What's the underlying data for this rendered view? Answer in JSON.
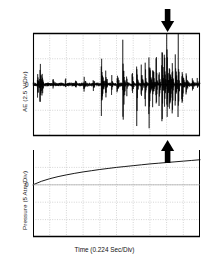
{
  "figure": {
    "title": "",
    "background": "#ffffff",
    "ink_color": "#000000",
    "grid_color": "#b9b9b9",
    "panel_left_px": 33,
    "panel_right_px": 200
  },
  "labels": {
    "ae_axis": "AE (2.5 V/Div)",
    "pressure_axis": "Pressure (5 Atm/Div)",
    "time_axis": "Time (0.224 Sec/Div)",
    "ae_zero": "0",
    "pressure_zero": "0"
  },
  "annotations": [
    {
      "name": "burst-onset-arrow-top",
      "direction": "down",
      "x_frac": 0.806,
      "panel": "ae"
    },
    {
      "name": "burst-onset-arrow-bottom",
      "direction": "up",
      "x_frac": 0.806,
      "panel": "pressure"
    }
  ],
  "chart_data": {
    "type": "line",
    "title": "",
    "xlabel": "Time (0.224 Sec/Div)",
    "grid": true,
    "legend": "none",
    "panels": [
      {
        "name": "acoustic-emission",
        "ylabel": "AE (2.5 V/Div)",
        "ylim": [
          -2,
          2
        ],
        "ytick_labeled": [
          0
        ],
        "xlim": [
          0,
          10
        ],
        "x_divisions": 10,
        "y_divisions": 4,
        "description": "Acoustic emission voltage versus time showing intermittent burst events increasing in rate and amplitude toward the right, with a dense cluster of large bursts just before the arrow marker.",
        "bursts": [
          {
            "t": 0.28,
            "amp": 0.62
          },
          {
            "t": 0.42,
            "amp": 0.95
          },
          {
            "t": 0.55,
            "amp": 0.5
          },
          {
            "t": 1.2,
            "amp": 0.22
          },
          {
            "t": 1.95,
            "amp": 0.18
          },
          {
            "t": 2.55,
            "amp": 0.3
          },
          {
            "t": 3.05,
            "amp": 0.26
          },
          {
            "t": 3.62,
            "amp": 0.24
          },
          {
            "t": 4.1,
            "amp": 1.22
          },
          {
            "t": 4.35,
            "amp": 0.55
          },
          {
            "t": 4.72,
            "amp": 0.34
          },
          {
            "t": 5.05,
            "amp": 0.42
          },
          {
            "t": 5.38,
            "amp": 1.55
          },
          {
            "t": 5.62,
            "amp": 0.48
          },
          {
            "t": 5.95,
            "amp": 0.6
          },
          {
            "t": 6.22,
            "amp": 1.3
          },
          {
            "t": 6.48,
            "amp": 0.7
          },
          {
            "t": 6.72,
            "amp": 1.05
          },
          {
            "t": 6.95,
            "amp": 1.48
          },
          {
            "t": 7.18,
            "amp": 0.86
          },
          {
            "t": 7.38,
            "amp": 1.6
          },
          {
            "t": 7.55,
            "amp": 1.1
          },
          {
            "t": 7.72,
            "amp": 1.75
          },
          {
            "t": 7.88,
            "amp": 1.35
          },
          {
            "t": 8.02,
            "amp": 1.92
          },
          {
            "t": 8.18,
            "amp": 1.45
          },
          {
            "t": 8.34,
            "amp": 1.68
          },
          {
            "t": 8.52,
            "amp": 1.2
          },
          {
            "t": 8.7,
            "amp": 1.85
          },
          {
            "t": 8.92,
            "amp": 0.92
          },
          {
            "t": 9.18,
            "amp": 0.46
          },
          {
            "t": 9.55,
            "amp": 0.3
          },
          {
            "t": 9.85,
            "amp": 0.22
          }
        ],
        "baseline_noise_amp": 0.07
      },
      {
        "name": "pressure",
        "ylabel": "Pressure (5 Atm/Div)",
        "ylim": [
          -3,
          2
        ],
        "ytick_labeled": [
          0
        ],
        "xlim": [
          0,
          10
        ],
        "x_divisions": 10,
        "y_divisions": 5,
        "description": "Pressure rises monotonically from zero with a gradually decreasing slope (concave-down, root-like growth) across the full time window.",
        "x": [
          0,
          0.5,
          1,
          1.5,
          2,
          2.5,
          3,
          3.5,
          4,
          4.5,
          5,
          5.5,
          6,
          6.5,
          7,
          7.5,
          8,
          8.5,
          9,
          9.5,
          10
        ],
        "y": [
          0.0,
          0.2,
          0.35,
          0.47,
          0.57,
          0.66,
          0.74,
          0.81,
          0.88,
          0.94,
          1.0,
          1.05,
          1.1,
          1.15,
          1.2,
          1.24,
          1.28,
          1.32,
          1.36,
          1.4,
          1.44
        ]
      }
    ]
  }
}
